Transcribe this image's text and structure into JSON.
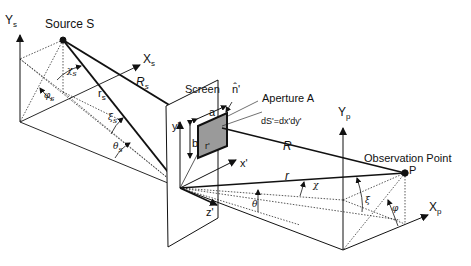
{
  "diagram": {
    "type": "diffraction geometry",
    "labels": {
      "ys": "Y",
      "ys_sub": "s",
      "source": "Source S",
      "xs": "X",
      "xs_sub": "s",
      "chi_s": "χ",
      "chi_s_sub": "s",
      "phi_s": "φ",
      "phi_s_sub": "s",
      "r_s": "r",
      "r_s_sub": "s",
      "R_s": "R",
      "R_s_sub": "s",
      "xi_s": "ξ",
      "xi_s_sub": "s",
      "theta_s": "θ",
      "theta_s_sub": "s",
      "screen": "Screen",
      "n_prime": "n̂'",
      "aperture": "Aperture A",
      "dS": "dS'=dx'dy'",
      "a": "a",
      "b": "b",
      "y_prime": "y'",
      "x_prime": "x'",
      "z_prime": "z'",
      "r_prime": "r'",
      "R": "R",
      "r": "r",
      "theta": "θ",
      "chi": "χ",
      "xi": "ξ",
      "phi": "φ",
      "yp": "Y",
      "yp_sub": "p",
      "xp": "X",
      "xp_sub": "p",
      "observation": "Observation Point",
      "P": "P"
    },
    "colors": {
      "line": "#111111",
      "aperture_fill": "#9a9a9a",
      "dotted": "#555555"
    }
  }
}
